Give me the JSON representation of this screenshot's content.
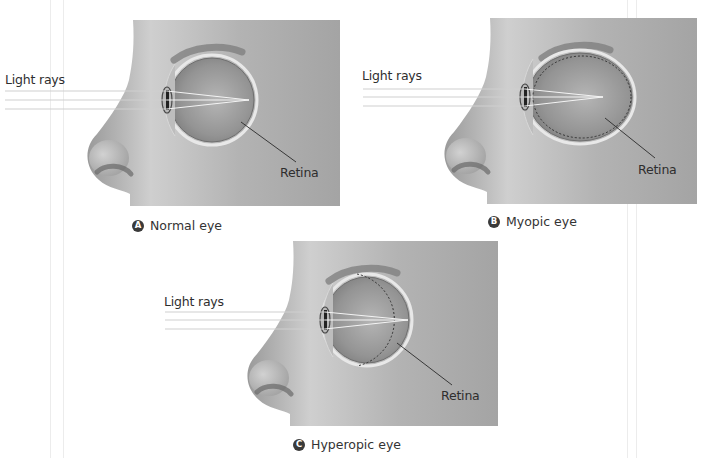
{
  "figure": {
    "guides_x": [
      50,
      63,
      627,
      636
    ],
    "colors": {
      "panel_bg": "#a9a9a9",
      "skin_light": "#d2d2d2",
      "skin_dark": "#8e8e8e",
      "eye_inner": "#9b9b9b",
      "eye_rim": "#e8e8e8",
      "ray": "#f4f4f4",
      "pointer": "#2a2a2a",
      "badge": "#3a3a3a"
    },
    "panels": [
      {
        "id": "A",
        "badge": "A",
        "caption": "Normal eye",
        "light_rays_label": "Light rays",
        "retina_label": "Retina",
        "box": {
          "x": 133,
          "y": 20,
          "w": 207,
          "h": 186
        },
        "eye": {
          "cx": 212,
          "cy": 100,
          "rx": 42,
          "ry": 42
        },
        "lens_x": 167,
        "focus": {
          "x": 249,
          "y": 100
        },
        "rays_y": [
          91,
          100,
          109
        ],
        "ray_start_x": 5,
        "retina_dashed": "none",
        "pointer": {
          "x1": 241,
          "y1": 122,
          "x2": 296,
          "y2": 162
        },
        "light_label_pos": {
          "x": 5,
          "y": 72
        },
        "retina_label_pos": {
          "x": 280,
          "y": 165
        },
        "caption_pos": {
          "x": 132,
          "y": 218
        }
      },
      {
        "id": "B",
        "badge": "B",
        "caption": "Myopic eye",
        "light_rays_label": "Light rays",
        "retina_label": "Retina",
        "box": {
          "x": 490,
          "y": 18,
          "w": 207,
          "h": 186
        },
        "eye": {
          "cx": 580,
          "cy": 97,
          "rx": 52,
          "ry": 44
        },
        "lens_x": 525,
        "focus": {
          "x": 603,
          "y": 97
        },
        "rays_y": [
          89,
          97,
          106
        ],
        "ray_start_x": 363,
        "retina_dashed": "inside",
        "pointer": {
          "x1": 605,
          "y1": 118,
          "x2": 655,
          "y2": 158
        },
        "light_label_pos": {
          "x": 362,
          "y": 68
        },
        "retina_label_pos": {
          "x": 638,
          "y": 162
        },
        "caption_pos": {
          "x": 488,
          "y": 214
        }
      },
      {
        "id": "C",
        "badge": "C",
        "caption": "Hyperopic eye",
        "light_rays_label": "Light rays",
        "retina_label": "Retina",
        "box": {
          "x": 293,
          "y": 241,
          "w": 205,
          "h": 185
        },
        "eye": {
          "cx": 367,
          "cy": 320,
          "rx": 42,
          "ry": 43
        },
        "lens_x": 325,
        "focus": {
          "x": 408,
          "y": 320
        },
        "rays_y": [
          312,
          320,
          329
        ],
        "ray_start_x": 165,
        "retina_dashed": "outside",
        "pointer": {
          "x1": 397,
          "y1": 343,
          "x2": 452,
          "y2": 385
        },
        "light_label_pos": {
          "x": 164,
          "y": 294
        },
        "retina_label_pos": {
          "x": 441,
          "y": 388
        },
        "caption_pos": {
          "x": 293,
          "y": 437
        }
      }
    ]
  }
}
